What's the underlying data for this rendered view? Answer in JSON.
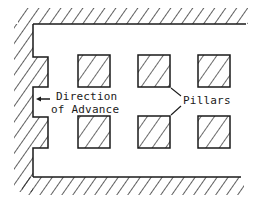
{
  "diagram": {
    "type": "mine plan view - room and pillar",
    "labels": {
      "direction_line1": "Direction",
      "direction_line2": "of Advance",
      "pillars": "Pillars"
    },
    "colors": {
      "ink": "#1a1a1a",
      "background": "#ffffff"
    },
    "pillars": [
      {
        "row": 1,
        "col": 1,
        "x": 78,
        "y": 55,
        "w": 32,
        "h": 32
      },
      {
        "row": 1,
        "col": 2,
        "x": 138,
        "y": 55,
        "w": 32,
        "h": 32
      },
      {
        "row": 1,
        "col": 3,
        "x": 198,
        "y": 55,
        "w": 32,
        "h": 32
      },
      {
        "row": 2,
        "col": 1,
        "x": 78,
        "y": 116,
        "w": 32,
        "h": 32
      },
      {
        "row": 2,
        "col": 2,
        "x": 138,
        "y": 116,
        "w": 32,
        "h": 32
      },
      {
        "row": 2,
        "col": 3,
        "x": 198,
        "y": 116,
        "w": 32,
        "h": 32
      }
    ],
    "arrow": {
      "direction": "left"
    }
  }
}
